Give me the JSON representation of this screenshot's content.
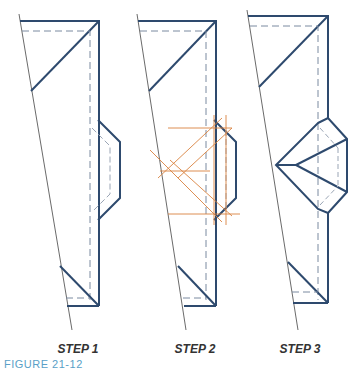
{
  "figure": {
    "steps": [
      {
        "label": "STEP 1"
      },
      {
        "label": "STEP 2"
      },
      {
        "label": "STEP 3"
      }
    ],
    "caption": "FIGURE 21-12"
  },
  "colors": {
    "outline": "#2e4a6e",
    "dashed": "#7a8aa0",
    "guide": "#d9823f",
    "thin": "#444444",
    "caption": "#5a9fc7"
  }
}
